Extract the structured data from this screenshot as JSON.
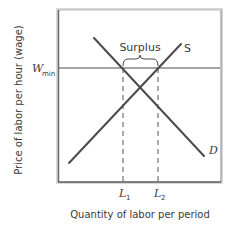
{
  "diagram": {
    "type": "supply-demand-minimum-wage",
    "y_axis_label": "Price of labor per hour (wage)",
    "x_axis_label": "Quantity of labor per period",
    "price_floor_label": {
      "main": "W",
      "sub": "min"
    },
    "supply_label": "S",
    "demand_label": "D",
    "surplus_label": "Surplus",
    "quantity_marks": [
      {
        "main": "L",
        "sub": "1"
      },
      {
        "main": "L",
        "sub": "2"
      }
    ],
    "colors": {
      "line": "#4a4a4a",
      "frame": "#5a5a5a",
      "text": "#3a3a3a",
      "background": "#ffffff"
    }
  }
}
